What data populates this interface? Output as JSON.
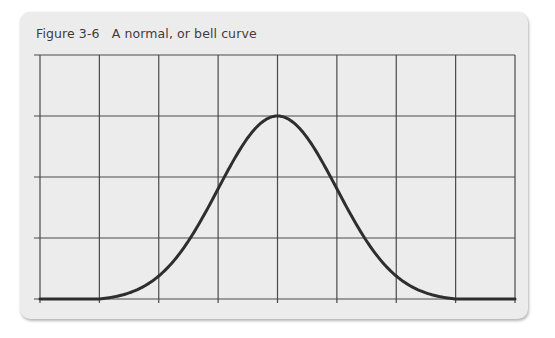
{
  "figure": {
    "label": "Figure 3-6",
    "caption": "A normal, or bell curve",
    "title_full": "Figure 3-6   A normal, or bell curve"
  },
  "colors": {
    "panel_background": "#ececec",
    "page_background": "#ffffff",
    "grid_line": "#4a4a4a",
    "curve": "#2e2e2e",
    "title_text": "#3d3d3d"
  },
  "chart_data": {
    "type": "line",
    "title": "Figure 3-6 A normal, or bell curve",
    "xlabel": "",
    "ylabel": "",
    "grid": true,
    "grid_columns": 8,
    "grid_rows": 4,
    "xlim": [
      -4,
      4
    ],
    "ylim": [
      0,
      4
    ],
    "tick_labels_shown": false,
    "legend": null,
    "series": [
      {
        "name": "Normal (bell) curve",
        "description": "Symmetric bell-shaped curve centered at x=0, peaking at 3 grid units, flat at 0 beyond |x|>=3",
        "x": [
          -4,
          -3,
          -2.5,
          -2,
          -1.6,
          -1,
          -0.5,
          0,
          0.5,
          1,
          1.6,
          2,
          2.5,
          3,
          4
        ],
        "values": [
          0,
          0,
          0.25,
          0.85,
          1.5,
          2.3,
          2.85,
          3.0,
          2.85,
          2.3,
          1.5,
          0.85,
          0.25,
          0,
          0
        ]
      }
    ]
  }
}
